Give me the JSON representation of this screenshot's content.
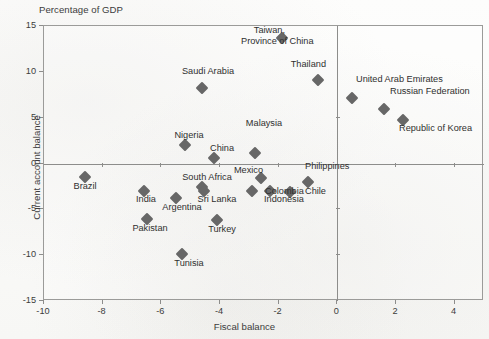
{
  "unit_note": "Percentage of GDP",
  "axis": {
    "xlabel": "Fiscal balance",
    "ylabel": "Current account balance",
    "xticks": [
      "-10",
      "-8",
      "-6",
      "-4",
      "-2",
      "0",
      "2",
      "4"
    ],
    "yticks": [
      "15",
      "10",
      "5",
      "0",
      "-5",
      "-10",
      "-15"
    ]
  },
  "colors": {
    "marker": "#676767",
    "frame": "#9b9b99",
    "axis": "#8d8d8b",
    "text": "#2f2f2f",
    "background": "#fbfbfa"
  },
  "chart_data": {
    "type": "scatter",
    "title": "",
    "subtitle": "",
    "unit_note": "Percentage of GDP",
    "xlabel": "Fiscal balance",
    "ylabel": "Current account balance",
    "xlim": [
      -10,
      5
    ],
    "ylim": [
      -15,
      15
    ],
    "xticks": [
      -10,
      -8,
      -6,
      -4,
      -2,
      0,
      2,
      4
    ],
    "yticks": [
      15,
      10,
      5,
      0,
      -5,
      -10,
      -15
    ],
    "grid": false,
    "reference_lines": [
      {
        "axis": "x",
        "value": 0
      },
      {
        "axis": "y",
        "value": 0
      }
    ],
    "legend": null,
    "points": [
      {
        "name": "Taiwan, Province of China",
        "x": -1.9,
        "y": 13.7,
        "label": "Taiwan,\nProvince of China",
        "label_pos": "left"
      },
      {
        "name": "Thailand",
        "x": -0.65,
        "y": 9.1,
        "label": "Thailand",
        "label_pos": "above-left"
      },
      {
        "name": "Saudi Arabia",
        "x": -4.6,
        "y": 8.2,
        "label": "Saudi Arabia",
        "label_pos": "above"
      },
      {
        "name": "United Arab Emirates",
        "x": 0.5,
        "y": 7.2,
        "label": "United Arab Emirates",
        "label_pos": "above"
      },
      {
        "name": "Russian Federation",
        "x": 1.6,
        "y": 6.0,
        "label": "Russian Federation",
        "label_pos": "above-right"
      },
      {
        "name": "Republic of Korea",
        "x": 2.25,
        "y": 4.7,
        "label": "Republic of Korea",
        "label_pos": "below-right"
      },
      {
        "name": "Nigeria",
        "x": -5.2,
        "y": 2.0,
        "label": "Nigeria",
        "label_pos": "above"
      },
      {
        "name": "Malaysia",
        "x": -2.8,
        "y": 1.1,
        "label": "Malaysia",
        "label_pos": "above"
      },
      {
        "name": "China",
        "x": -4.2,
        "y": 0.6,
        "label": "China",
        "label_pos": "above"
      },
      {
        "name": "Brazil",
        "x": -8.6,
        "y": -1.5,
        "label": "Brazil",
        "label_pos": "below"
      },
      {
        "name": "Mexico",
        "x": -2.6,
        "y": -1.6,
        "label": "Mexico",
        "label_pos": "left"
      },
      {
        "name": "Philippines",
        "x": -1.0,
        "y": -2.0,
        "label": "Philippines",
        "label_pos": "above"
      },
      {
        "name": "South Africa",
        "x": -4.6,
        "y": -2.6,
        "label": "South Africa",
        "label_pos": "above"
      },
      {
        "name": "Colombia",
        "x": -2.9,
        "y": -3.0,
        "label": "Colombia",
        "label_pos": "right"
      },
      {
        "name": "India",
        "x": -6.6,
        "y": -3.0,
        "label": "India",
        "label_pos": "below"
      },
      {
        "name": "Indonesia",
        "x": -2.3,
        "y": -3.0,
        "label": "Indonesia",
        "label_pos": "below"
      },
      {
        "name": "Chile",
        "x": -1.6,
        "y": -3.1,
        "label": "Chile",
        "label_pos": "right"
      },
      {
        "name": "Sri Lanka",
        "x": -4.55,
        "y": -3.0,
        "label": "Sri Lanka",
        "label_pos": "below"
      },
      {
        "name": "Argentina",
        "x": -5.5,
        "y": -3.8,
        "label": "Argentina",
        "label_pos": "below"
      },
      {
        "name": "Turkey",
        "x": -4.1,
        "y": -6.2,
        "label": "Turkey",
        "label_pos": "below"
      },
      {
        "name": "Pakistan",
        "x": -6.5,
        "y": -6.1,
        "label": "Pakistan",
        "label_pos": "below"
      },
      {
        "name": "Tunisia",
        "x": -5.3,
        "y": -9.9,
        "label": "Tunisia",
        "label_pos": "below"
      }
    ]
  },
  "labels": [
    {
      "text": "Taiwan,",
      "x": 285,
      "y": 25,
      "align": "right"
    },
    {
      "text": "Province of China",
      "x": 241,
      "y": 36,
      "align": "left"
    },
    {
      "text": "Thailand",
      "x": 326,
      "y": 59,
      "align": "right"
    },
    {
      "text": "Saudi Arabia",
      "x": 208,
      "y": 66,
      "align": "center"
    },
    {
      "text": "United Arab Emirates",
      "x": 356,
      "y": 74,
      "align": "left"
    },
    {
      "text": "Russian Federation",
      "x": 390,
      "y": 86,
      "align": "left"
    },
    {
      "text": "Republic of Korea",
      "x": 399,
      "y": 123,
      "align": "left"
    },
    {
      "text": "Nigeria",
      "x": 189,
      "y": 130,
      "align": "center"
    },
    {
      "text": "Malaysia",
      "x": 264,
      "y": 118,
      "align": "center"
    },
    {
      "text": "China",
      "x": 222,
      "y": 143,
      "align": "center"
    },
    {
      "text": "Brazil",
      "x": 85,
      "y": 181,
      "align": "center"
    },
    {
      "text": "Mexico",
      "x": 263,
      "y": 165,
      "align": "right"
    },
    {
      "text": "Philippines",
      "x": 305,
      "y": 161,
      "align": "left"
    },
    {
      "text": "South Africa",
      "x": 207,
      "y": 172,
      "align": "center"
    },
    {
      "text": "Colombia",
      "x": 265,
      "y": 186,
      "align": "left"
    },
    {
      "text": "India",
      "x": 146,
      "y": 194,
      "align": "center"
    },
    {
      "text": "Indonesia",
      "x": 264,
      "y": 194,
      "align": "left"
    },
    {
      "text": "Chile",
      "x": 305,
      "y": 186,
      "align": "left"
    },
    {
      "text": "Sri Lanka",
      "x": 217,
      "y": 194,
      "align": "center"
    },
    {
      "text": "Argentina",
      "x": 182,
      "y": 202,
      "align": "center"
    },
    {
      "text": "Turkey",
      "x": 222,
      "y": 224,
      "align": "center"
    },
    {
      "text": "Pakistan",
      "x": 150,
      "y": 223,
      "align": "center"
    },
    {
      "text": "Tunisia",
      "x": 189,
      "y": 258,
      "align": "center"
    }
  ]
}
